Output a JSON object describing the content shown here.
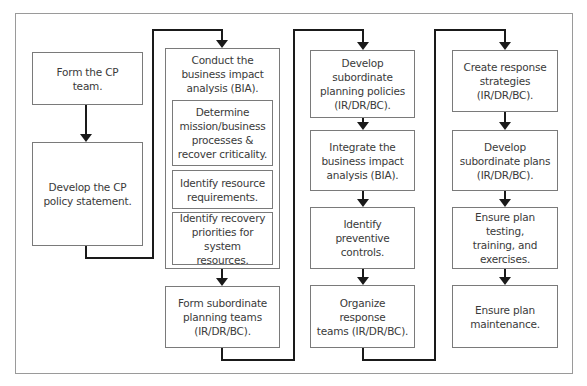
{
  "diagram": {
    "type": "flowchart",
    "columns": [
      {
        "steps": [
          {
            "label": "Form the CP\nteam."
          },
          {
            "label": "Develop the CP\npolicy statement."
          }
        ]
      },
      {
        "group": {
          "label": "Conduct the\nbusiness impact\nanalysis (BIA).",
          "substeps": [
            {
              "label": "Determine\nmission/business\nprocesses &\nrecover criticality."
            },
            {
              "label": "Identify resource\nrequirements."
            },
            {
              "label": "Identify recovery\npriorities for\nsystem resources."
            }
          ]
        },
        "steps": [
          {
            "label": "Form subordinate\nplanning teams\n(IR/DR/BC)."
          }
        ]
      },
      {
        "steps": [
          {
            "label": "Develop\nsubordinate\nplanning policies\n(IR/DR/BC)."
          },
          {
            "label": "Integrate the\nbusiness impact\nanalysis (BIA)."
          },
          {
            "label": "Identify preventive\ncontrols."
          },
          {
            "label": "Organize\nresponse\nteams (IR/DR/BC)."
          }
        ]
      },
      {
        "steps": [
          {
            "label": "Create response\nstrategies\n(IR/DR/BC)."
          },
          {
            "label": "Develop\nsubordinate plans\n(IR/DR/BC)."
          },
          {
            "label": "Ensure plan testing,\ntraining, and\nexercises."
          },
          {
            "label": "Ensure plan\nmaintenance."
          }
        ]
      }
    ],
    "colors": {
      "connector": "#1a1a1a",
      "box_border": "#7a7a7a",
      "text": "#3a3a3a",
      "frame": "#9a9a9a"
    }
  }
}
